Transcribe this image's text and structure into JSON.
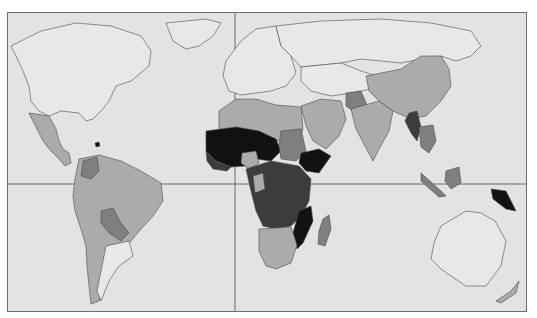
{
  "map": {
    "type": "choropleth-world-map",
    "legend_visible": false,
    "reference_lines": [
      "prime-meridian",
      "equator"
    ],
    "shade_classes": [
      {
        "id": "c0",
        "color": "#e8e8e8",
        "meaning": "no data / lowest"
      },
      {
        "id": "c1",
        "color": "#ababab",
        "meaning": "low"
      },
      {
        "id": "c2",
        "color": "#7f7f7f",
        "meaning": "medium"
      },
      {
        "id": "c3",
        "color": "#3c3c3c",
        "meaning": "high"
      },
      {
        "id": "c4",
        "color": "#111111",
        "meaning": "highest"
      }
    ],
    "colors": {
      "ocean": "#e3e3e3",
      "border": "#6e6e6e",
      "outline": "#4a4a4a"
    },
    "regions": [
      {
        "name": "north-america",
        "class": "c0"
      },
      {
        "name": "greenland",
        "class": "c0"
      },
      {
        "name": "mexico-central-america",
        "class": "c1"
      },
      {
        "name": "south-america",
        "class": "c1"
      },
      {
        "name": "bolivia-paraguay",
        "class": "c2"
      },
      {
        "name": "argentina-chile-south",
        "class": "c0"
      },
      {
        "name": "europe",
        "class": "c0"
      },
      {
        "name": "russia",
        "class": "c0"
      },
      {
        "name": "north-africa",
        "class": "c1"
      },
      {
        "name": "sahel-west-africa",
        "class": "c4"
      },
      {
        "name": "central-africa",
        "class": "c3"
      },
      {
        "name": "east-africa-ethiopia",
        "class": "c4"
      },
      {
        "name": "southern-africa",
        "class": "c1"
      },
      {
        "name": "madagascar",
        "class": "c2"
      },
      {
        "name": "middle-east",
        "class": "c1"
      },
      {
        "name": "afghanistan",
        "class": "c2"
      },
      {
        "name": "south-asia",
        "class": "c1"
      },
      {
        "name": "china",
        "class": "c1"
      },
      {
        "name": "myanmar",
        "class": "c3"
      },
      {
        "name": "southeast-asia",
        "class": "c2"
      },
      {
        "name": "papua-new-guinea",
        "class": "c4"
      },
      {
        "name": "australia",
        "class": "c0"
      },
      {
        "name": "new-zealand",
        "class": "c1"
      }
    ]
  }
}
